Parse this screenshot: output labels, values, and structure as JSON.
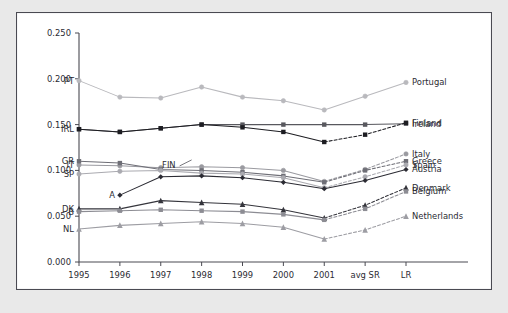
{
  "figure": {
    "background": "#ffffff",
    "page_background": "#e9e9e9",
    "frame_color": "#4a4a52"
  },
  "chart_data": {
    "type": "line",
    "title": "",
    "subtitle": "",
    "xlabel": "",
    "ylabel": "",
    "grid": false,
    "legend_position": "right-inline-labels",
    "categories": [
      "1995",
      "1996",
      "1997",
      "1998",
      "1999",
      "2000",
      "2001",
      "avg SR",
      "LR"
    ],
    "x_tick_labels": [
      "1995",
      "1996",
      "1997",
      "1998",
      "1999",
      "2000",
      "2001",
      "avg SR",
      "LR"
    ],
    "y_tick_labels": [
      "0.000",
      "0.050",
      "0.100",
      "0.150",
      "0.200",
      "0.250"
    ],
    "y_tick_values": [
      0.0,
      0.05,
      0.1,
      0.15,
      0.2,
      0.25
    ],
    "ylim": [
      0.0,
      0.25
    ],
    "xlim_categories": [
      0,
      8
    ],
    "dashed_from_index": 6,
    "series": [
      {
        "name": "Portugal",
        "left_label": "PT",
        "right_label": "Portugal",
        "color": "#b9b9bd",
        "marker": "circle",
        "values": [
          0.198,
          0.18,
          0.179,
          0.191,
          0.18,
          0.176,
          0.166,
          0.181,
          0.196
        ],
        "dashed_tail": false
      },
      {
        "name": "Ireland",
        "left_label": "IRL",
        "right_label": "Ireland",
        "color": "#58585e",
        "marker": "square",
        "values": [
          0.145,
          0.142,
          0.146,
          0.15,
          0.15,
          0.15,
          0.15,
          0.15,
          0.151
        ],
        "dashed_tail": false
      },
      {
        "name": "Finland",
        "left_label": "",
        "right_label": "Finland",
        "color": "#1d1d22",
        "marker": "square",
        "values": [
          0.145,
          0.142,
          0.146,
          0.15,
          0.147,
          0.142,
          0.131,
          0.139,
          0.152
        ],
        "dashed_tail": true
      },
      {
        "name": "Italy",
        "left_label": "IT",
        "right_label": "Italy",
        "color": "#9a9aa0",
        "marker": "circle",
        "values": [
          0.106,
          0.105,
          0.103,
          0.104,
          0.103,
          0.1,
          0.088,
          0.101,
          0.118
        ],
        "dashed_tail": true
      },
      {
        "name": "Greece",
        "left_label": "GR",
        "right_label": "Greece",
        "color": "#6e6e76",
        "marker": "square",
        "values": [
          0.11,
          0.108,
          0.101,
          0.1,
          0.098,
          0.094,
          0.087,
          0.1,
          0.11
        ],
        "dashed_tail": true
      },
      {
        "name": "Spain",
        "left_label": "SP",
        "right_label": "Spain",
        "color": "#aaaab0",
        "marker": "circle",
        "values": [
          0.096,
          0.099,
          0.1,
          0.097,
          0.096,
          0.092,
          0.081,
          0.093,
          0.106
        ],
        "dashed_tail": true
      },
      {
        "name": "Austria",
        "left_label": "A",
        "right_label": "Austria",
        "color": "#2b2b33",
        "marker": "diamond",
        "values": [
          null,
          0.073,
          0.093,
          0.094,
          0.092,
          0.087,
          0.08,
          0.089,
          0.101
        ],
        "dashed_tail": false
      },
      {
        "name": "Denmark",
        "left_label": "DK",
        "right_label": "Denmark",
        "color": "#35353c",
        "marker": "triangle",
        "values": [
          0.058,
          0.058,
          0.067,
          0.065,
          0.063,
          0.057,
          0.048,
          0.062,
          0.081
        ],
        "dashed_tail": true
      },
      {
        "name": "Belgium",
        "left_label": "B",
        "right_label": "Belgium",
        "color": "#8c8c93",
        "marker": "square",
        "values": [
          0.055,
          0.056,
          0.057,
          0.056,
          0.055,
          0.052,
          0.046,
          0.058,
          0.077
        ],
        "dashed_tail": true
      },
      {
        "name": "Netherlands",
        "left_label": "NL",
        "right_label": "Netherlands",
        "color": "#9d9da3",
        "marker": "triangle",
        "values": [
          0.036,
          0.04,
          0.042,
          0.044,
          0.042,
          0.038,
          0.025,
          0.035,
          0.05
        ],
        "dashed_tail": true
      }
    ],
    "annotations": [
      {
        "text": "FIN",
        "x_index": 3.0,
        "y_value": 0.118
      }
    ]
  }
}
